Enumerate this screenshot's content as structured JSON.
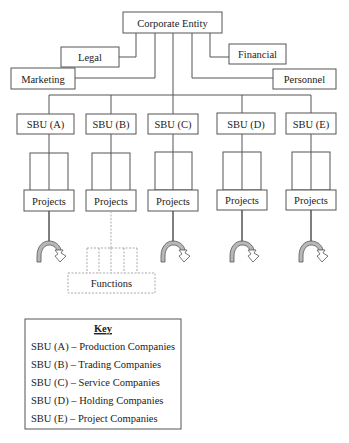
{
  "diagram": {
    "root": {
      "label": "Corporate Entity"
    },
    "support_functions": [
      {
        "id": "legal",
        "label": "Legal"
      },
      {
        "id": "marketing",
        "label": "Marketing"
      },
      {
        "id": "financial",
        "label": "Financial"
      },
      {
        "id": "personnel",
        "label": "Personnel"
      }
    ],
    "sbus": [
      {
        "id": "A",
        "label": "SBU (A)",
        "projects_label": "Projects"
      },
      {
        "id": "B",
        "label": "SBU (B)",
        "projects_label": "Projects"
      },
      {
        "id": "C",
        "label": "SBU (C)",
        "projects_label": "Projects"
      },
      {
        "id": "D",
        "label": "SBU (D)",
        "projects_label": "Projects"
      },
      {
        "id": "E",
        "label": "SBU (E)",
        "projects_label": "Projects"
      }
    ],
    "functions_box": {
      "label": "Functions"
    },
    "key": {
      "title": "Key",
      "entries": [
        "SBU (A) – Production Companies",
        "SBU (B) – Trading Companies",
        "SBU (C) – Service Companies",
        "SBU (D) – Holding Companies",
        "SBU (E) – Project Companies"
      ]
    }
  }
}
